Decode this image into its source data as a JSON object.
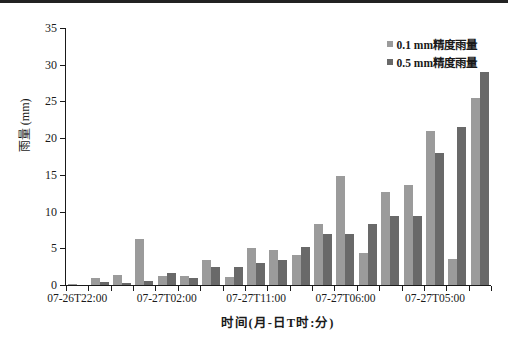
{
  "page": {
    "background": "#ffffff",
    "top_border_color": "#222222"
  },
  "chart_data": {
    "type": "bar",
    "title": "",
    "xlabel": "时间(月-日T时:分)",
    "ylabel": "雨量 (mm)",
    "ylim": [
      0,
      35
    ],
    "yticks": [
      0,
      5,
      10,
      15,
      20,
      25,
      30,
      35
    ],
    "grid": false,
    "legend_position": "top-right",
    "axis_color": "#1a1a1a",
    "x_tick_labels": [
      "07-26T22:00",
      "07-27T02:00",
      "07-27T11:00",
      "07-27T06:00",
      "07-27T05:00"
    ],
    "x_tick_label_group_indices": [
      0,
      4,
      8,
      12,
      16
    ],
    "group_count": 19,
    "series": [
      {
        "name": "0.1 mm精度雨量",
        "color": "#9b9b9b",
        "values": [
          0.2,
          1.0,
          1.3,
          6.2,
          1.2,
          1.2,
          3.4,
          1.1,
          5.1,
          4.8,
          4.1,
          8.3,
          14.8,
          4.3,
          12.7,
          13.6,
          21.0,
          3.5,
          25.5
        ]
      },
      {
        "name": "0.5 mm精度雨量",
        "color": "#696969",
        "values": [
          0.0,
          0.4,
          0.3,
          0.5,
          1.6,
          1.0,
          2.5,
          2.5,
          3.0,
          3.4,
          5.2,
          6.9,
          6.9,
          8.3,
          9.4,
          9.4,
          18.0,
          21.5,
          29.0
        ]
      }
    ]
  }
}
